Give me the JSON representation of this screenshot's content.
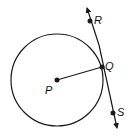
{
  "diagram": {
    "colors": {
      "stroke": "#1a1a1a",
      "background": "#ffffff"
    },
    "circle": {
      "center_label": "P",
      "cx": 57,
      "cy": 80,
      "r": 46
    },
    "points": [
      {
        "label": "P",
        "x": 57,
        "y": 80
      },
      {
        "label": "Q",
        "x": 102,
        "y": 67
      },
      {
        "label": "R",
        "x": 90,
        "y": 21
      },
      {
        "label": "S",
        "x": 113,
        "y": 113
      }
    ],
    "labels": {
      "P": "P",
      "Q": "Q",
      "R": "R",
      "S": "S"
    },
    "segments": [
      {
        "from": "P",
        "to": "Q",
        "name": "radius PQ"
      }
    ],
    "lines": [
      {
        "through": [
          "R",
          "S"
        ],
        "name": "tangent line RS",
        "arrows": "both"
      }
    ]
  }
}
